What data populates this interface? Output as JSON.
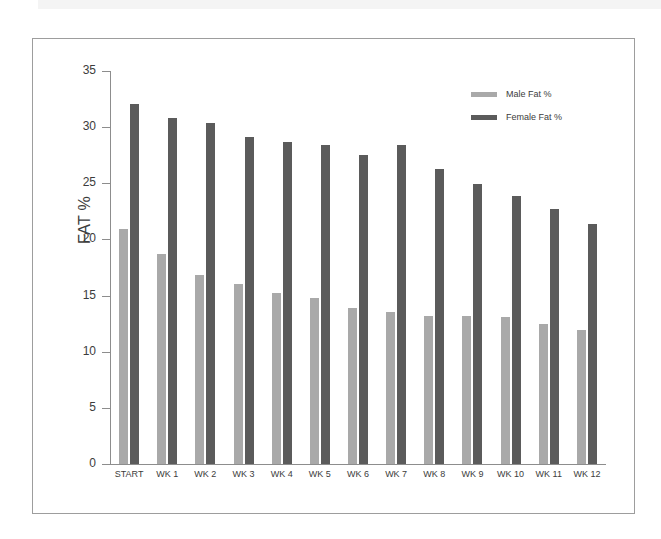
{
  "page": {
    "background_color": "#ffffff",
    "top_band_color": "#f4f4f4",
    "frame_border_color": "#9d9d9d"
  },
  "legend": {
    "position": "top-right-inside",
    "entries": [
      {
        "label": "Male Fat %",
        "color": "#a9a9a9"
      },
      {
        "label": "Female Fat %",
        "color": "#5b5b5b"
      }
    ]
  },
  "axes": {
    "y_title": "FAT %",
    "y_ticks": [
      "0",
      "5",
      "10",
      "15",
      "20",
      "25",
      "30",
      "35"
    ],
    "x_title": ""
  },
  "chart_data": {
    "type": "bar",
    "title": "",
    "subtitle": "",
    "xlabel": "",
    "ylabel": "FAT %",
    "ylim": [
      0,
      35
    ],
    "ytick_step": 5,
    "grid": false,
    "legend_position": "upper right",
    "categories": [
      "START",
      "WK 1",
      "WK 2",
      "WK 3",
      "WK 4",
      "WK 5",
      "WK 6",
      "WK 7",
      "WK 8",
      "WK 9",
      "WK 10",
      "WK 11",
      "WK 12"
    ],
    "series": [
      {
        "name": "Male Fat %",
        "color": "#a9a9a9",
        "values": [
          20.9,
          18.7,
          16.8,
          16.0,
          15.2,
          14.8,
          13.9,
          13.5,
          13.2,
          13.2,
          13.1,
          12.5,
          11.9
        ]
      },
      {
        "name": "Female Fat %",
        "color": "#5b5b5b",
        "values": [
          32.1,
          30.8,
          30.4,
          29.1,
          28.7,
          28.4,
          27.5,
          28.4,
          26.3,
          24.9,
          23.9,
          22.7,
          21.4
        ]
      }
    ]
  }
}
